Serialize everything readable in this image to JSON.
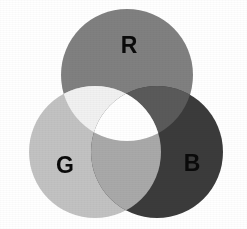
{
  "figure": {
    "type": "venn-diagram",
    "rendering": "grayscale",
    "background_color": "#ffffff",
    "width": 247,
    "height": 229,
    "label_color": "#0a0a0a"
  },
  "circles": [
    {
      "id": "red",
      "label": "R",
      "name": "Red",
      "color": "#808080",
      "cx": 127,
      "cy": 75,
      "r": 66,
      "label_x": 129,
      "label_y": 47
    },
    {
      "id": "green",
      "label": "G",
      "name": "Green",
      "color": "#c2c2c2",
      "cx": 95,
      "cy": 152,
      "r": 66,
      "label_x": 65,
      "label_y": 167
    },
    {
      "id": "blue",
      "label": "B",
      "name": "Blue",
      "color": "#3b3b3b",
      "cx": 157,
      "cy": 152,
      "r": 66,
      "label_x": 192,
      "label_y": 165
    }
  ],
  "intersections": [
    {
      "id": "red-green",
      "name": "Yellow",
      "members": [
        "red",
        "green"
      ],
      "color": "#f1f1f1"
    },
    {
      "id": "red-blue",
      "name": "Magenta",
      "members": [
        "red",
        "blue"
      ],
      "color": "#5a5a5a"
    },
    {
      "id": "green-blue",
      "name": "Cyan",
      "members": [
        "green",
        "blue"
      ],
      "color": "#a9a9a9"
    },
    {
      "id": "red-green-blue",
      "name": "White",
      "members": [
        "red",
        "green",
        "blue"
      ],
      "color": "#ffffff"
    }
  ]
}
